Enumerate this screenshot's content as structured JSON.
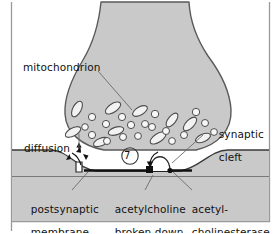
{
  "figure": {
    "step_number": "7",
    "colors": {
      "cell_fill": "#c9c9c9",
      "cell_outline": "#5a5a5a",
      "membrane_line": "#1a1a1a",
      "vesicle_fill": "#f5f5f5",
      "background": "#ffffff",
      "frame": "#9a9a9a",
      "text": "#111111"
    }
  },
  "labels": {
    "mitochondrion": "mitochondrion",
    "synaptic_cleft_line1": "synaptic",
    "synaptic_cleft_line2": "cleft",
    "diffusion": "diffusion",
    "postsynaptic_line1": "postsynaptic",
    "postsynaptic_line2": "membrane",
    "acetylcholine_line1": "acetylcholine",
    "acetylcholine_line2": "broken down",
    "acetylcholinesterase_line1": "acetyl-",
    "acetylcholinesterase_line2": "cholinesterase"
  },
  "structures": [
    {
      "name": "presynaptic-terminal",
      "description": "axon terminal bulb, gray filled"
    },
    {
      "name": "synaptic-vesicles",
      "count": 18,
      "description": "small white circles"
    },
    {
      "name": "mitochondria",
      "count": 10,
      "description": "white elongated ellipses"
    },
    {
      "name": "synaptic-cleft",
      "description": "white gap between terminal and postsynaptic cell"
    },
    {
      "name": "postsynaptic-membrane",
      "description": "dark horizontal band with central depression"
    },
    {
      "name": "receptor-channel",
      "description": "white notch in postsynaptic membrane"
    },
    {
      "name": "acetylcholinesterase-enzyme",
      "description": "dome shape on membrane with black square site"
    },
    {
      "name": "neurotransmitter-particles",
      "count": 3,
      "description": "small dark arrow-like marks diffusing across the cleft"
    }
  ]
}
